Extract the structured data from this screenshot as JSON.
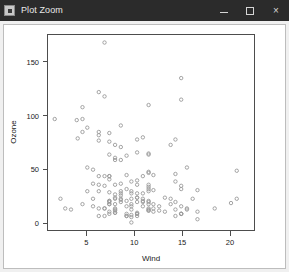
{
  "window": {
    "title": "Plot Zoom",
    "icon": "app-icon",
    "controls": {
      "minimize": "minimize-button",
      "maximize": "maximize-button",
      "close_label": "×"
    }
  },
  "chart_data": {
    "type": "scatter",
    "title": "",
    "xlabel": "Wind",
    "ylabel": "Ozone",
    "xlim": [
      1.0,
      22.5
    ],
    "ylim": [
      -6,
      175
    ],
    "xticks": [
      5,
      10,
      15,
      20
    ],
    "yticks": [
      0,
      50,
      100,
      150
    ],
    "grid": false,
    "legend": null,
    "marker": "open-circle",
    "marker_color": "#9a9a9a",
    "points": [
      [
        7.4,
        41
      ],
      [
        8.0,
        36
      ],
      [
        12.6,
        12
      ],
      [
        11.5,
        18
      ],
      [
        8.6,
        28
      ],
      [
        13.8,
        23
      ],
      [
        20.1,
        19
      ],
      [
        9.7,
        8
      ],
      [
        9.2,
        7
      ],
      [
        10.9,
        16
      ],
      [
        13.2,
        11
      ],
      [
        11.5,
        14
      ],
      [
        12.0,
        18
      ],
      [
        18.4,
        14
      ],
      [
        11.5,
        34
      ],
      [
        9.7,
        6
      ],
      [
        9.7,
        30
      ],
      [
        16.6,
        11
      ],
      [
        9.7,
        1
      ],
      [
        12.0,
        11
      ],
      [
        16.6,
        4
      ],
      [
        14.9,
        32
      ],
      [
        8.0,
        23
      ],
      [
        12.0,
        45
      ],
      [
        14.9,
        115
      ],
      [
        5.7,
        37
      ],
      [
        7.4,
        29
      ],
      [
        8.6,
        71
      ],
      [
        9.7,
        39
      ],
      [
        16.1,
        23
      ],
      [
        9.2,
        21
      ],
      [
        8.6,
        37
      ],
      [
        14.3,
        20
      ],
      [
        8.0,
        12
      ],
      [
        11.5,
        13
      ],
      [
        14.9,
        135
      ],
      [
        20.7,
        49
      ],
      [
        9.2,
        32
      ],
      [
        11.5,
        64
      ],
      [
        10.3,
        40
      ],
      [
        6.3,
        77
      ],
      [
        1.7,
        97
      ],
      [
        4.6,
        97
      ],
      [
        6.3,
        85
      ],
      [
        8.0,
        10
      ],
      [
        8.0,
        27
      ],
      [
        10.3,
        7
      ],
      [
        11.5,
        48
      ],
      [
        14.9,
        35
      ],
      [
        8.0,
        61
      ],
      [
        4.1,
        79
      ],
      [
        9.2,
        63
      ],
      [
        9.2,
        16
      ],
      [
        10.9,
        80
      ],
      [
        4.6,
        108
      ],
      [
        10.9,
        20
      ],
      [
        5.1,
        52
      ],
      [
        6.3,
        82
      ],
      [
        5.7,
        50
      ],
      [
        7.4,
        64
      ],
      [
        8.6,
        59
      ],
      [
        14.3,
        39
      ],
      [
        14.9,
        9
      ],
      [
        14.9,
        16
      ],
      [
        14.3,
        78
      ],
      [
        6.9,
        35
      ],
      [
        10.3,
        66
      ],
      [
        6.3,
        122
      ],
      [
        5.1,
        89
      ],
      [
        11.5,
        110
      ],
      [
        6.9,
        44
      ],
      [
        9.7,
        28
      ],
      [
        11.5,
        65
      ],
      [
        8.6,
        22
      ],
      [
        8.0,
        59
      ],
      [
        8.6,
        23
      ],
      [
        12.0,
        31
      ],
      [
        7.4,
        44
      ],
      [
        7.4,
        21
      ],
      [
        7.4,
        9
      ],
      [
        9.2,
        45
      ],
      [
        6.9,
        168
      ],
      [
        13.8,
        73
      ],
      [
        7.4,
        76
      ],
      [
        6.9,
        118
      ],
      [
        7.4,
        84
      ],
      [
        4.6,
        85
      ],
      [
        4.0,
        96
      ],
      [
        10.3,
        78
      ],
      [
        8.0,
        73
      ],
      [
        8.6,
        91
      ],
      [
        11.5,
        47
      ],
      [
        11.5,
        32
      ],
      [
        11.5,
        20
      ],
      [
        9.7,
        23
      ],
      [
        11.5,
        21
      ],
      [
        10.3,
        24
      ],
      [
        6.3,
        44
      ],
      [
        7.4,
        21
      ],
      [
        10.9,
        28
      ],
      [
        10.3,
        9
      ],
      [
        15.5,
        13
      ],
      [
        14.3,
        46
      ],
      [
        9.7,
        18
      ],
      [
        3.4,
        13
      ],
      [
        8.0,
        24
      ],
      [
        5.7,
        16
      ],
      [
        9.7,
        13
      ],
      [
        2.3,
        23
      ],
      [
        6.3,
        36
      ],
      [
        6.3,
        7
      ],
      [
        6.9,
        14
      ],
      [
        5.1,
        30
      ],
      [
        2.8,
        14
      ],
      [
        4.6,
        18
      ],
      [
        7.4,
        20
      ],
      [
        15.5,
        52
      ],
      [
        10.9,
        21
      ],
      [
        10.3,
        24
      ],
      [
        10.9,
        44
      ],
      [
        9.7,
        16
      ],
      [
        14.9,
        9
      ],
      [
        15.5,
        14
      ],
      [
        6.3,
        30
      ],
      [
        10.9,
        23
      ],
      [
        11.5,
        36
      ],
      [
        6.9,
        14
      ],
      [
        13.8,
        18
      ],
      [
        10.3,
        20
      ],
      [
        10.3,
        9
      ],
      [
        8.0,
        13
      ],
      [
        12.6,
        16
      ],
      [
        9.2,
        9
      ],
      [
        10.3,
        10
      ],
      [
        10.3,
        28
      ],
      [
        16.6,
        31
      ],
      [
        6.9,
        7
      ],
      [
        13.2,
        24
      ],
      [
        14.3,
        13
      ],
      [
        8.0,
        10
      ],
      [
        11.5,
        12
      ],
      [
        14.9,
        9
      ],
      [
        20.7,
        23
      ],
      [
        9.2,
        7
      ],
      [
        11.5,
        12
      ],
      [
        10.3,
        36
      ],
      [
        6.3,
        14
      ],
      [
        5.7,
        23
      ],
      [
        7.4,
        18
      ],
      [
        8.6,
        20
      ],
      [
        14.3,
        7
      ],
      [
        8.0,
        14
      ],
      [
        11.5,
        30
      ],
      [
        8.6,
        26
      ],
      [
        8.0,
        18
      ],
      [
        8.6,
        30
      ],
      [
        12.0,
        14
      ],
      [
        7.4,
        44
      ],
      [
        7.4,
        18
      ],
      [
        7.4,
        11
      ]
    ]
  }
}
